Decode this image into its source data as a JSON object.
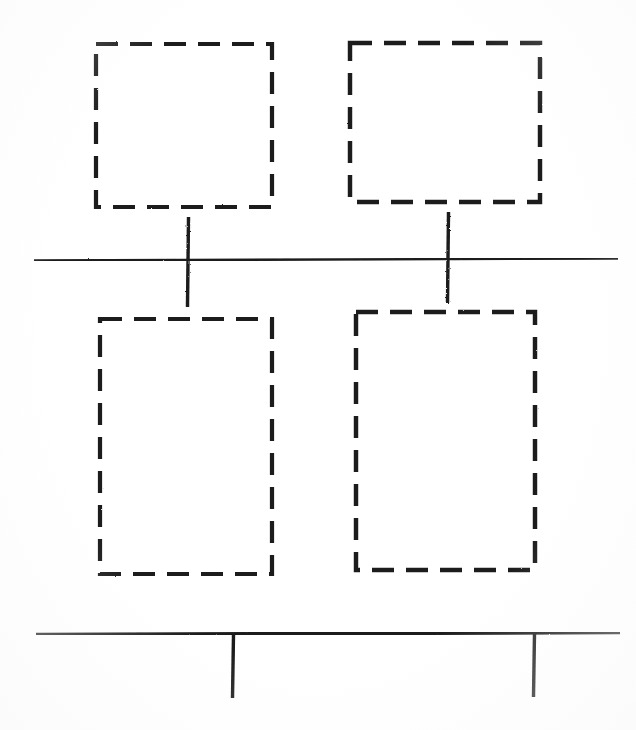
{
  "canvas": {
    "width": 636,
    "height": 730,
    "background_color": "#ffffff",
    "ink_color": "#1a1a1a",
    "medium": "scanned line drawing"
  },
  "figure": {
    "kind": "technical-line-drawing",
    "label_text": "",
    "caption_text": ""
  },
  "style": {
    "dashed_stroke_width": 4,
    "dash_length": 22,
    "dash_gap": 12,
    "center_line_stroke_width": 2.4,
    "base_line_stroke_width": 3.6,
    "tick_stroke_width": 3.4
  },
  "shapes": {
    "rectangles": [
      {
        "name": "top-left-dashed-rectangle",
        "x": 96,
        "y": 44,
        "width": 176,
        "height": 163,
        "stroke": "dashed",
        "fill": "none"
      },
      {
        "name": "top-right-dashed-rectangle",
        "x": 350,
        "y": 43,
        "width": 190,
        "height": 159,
        "stroke": "dashed",
        "fill": "none"
      },
      {
        "name": "bottom-left-dashed-rectangle",
        "x": 100,
        "y": 319,
        "width": 172,
        "height": 255,
        "stroke": "dashed",
        "fill": "none"
      },
      {
        "name": "bottom-right-dashed-rectangle",
        "x": 356,
        "y": 312,
        "width": 179,
        "height": 258,
        "stroke": "dashed",
        "fill": "none"
      }
    ],
    "horizontal_lines": [
      {
        "name": "center-horizontal-line",
        "x1": 34,
        "y1": 260,
        "x2": 618,
        "y2": 258,
        "stroke": "solid",
        "weight": "thin"
      },
      {
        "name": "bottom-baseline",
        "x1": 36,
        "y1": 634,
        "x2": 620,
        "y2": 632,
        "stroke": "solid",
        "weight": "thick"
      }
    ],
    "tick_marks": [
      {
        "name": "center-tick-left",
        "x": 188,
        "y1": 217,
        "y2": 307,
        "crosses_line": "center-horizontal-line"
      },
      {
        "name": "center-tick-right",
        "x": 448,
        "y1": 212,
        "y2": 303,
        "crosses_line": "center-horizontal-line"
      },
      {
        "name": "baseline-tick-left",
        "x": 233,
        "y1": 634,
        "y2": 698,
        "crosses_line": "bottom-baseline"
      },
      {
        "name": "baseline-tick-right",
        "x": 534,
        "y1": 633,
        "y2": 697,
        "crosses_line": "bottom-baseline"
      }
    ]
  }
}
